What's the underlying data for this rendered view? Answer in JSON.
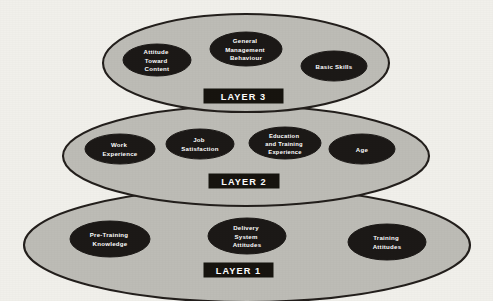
{
  "diagram": {
    "background_color": "#f1f0eb",
    "layer_fill_color": "#bdbcb6",
    "layer_stroke_color": "#231f1c",
    "node_fill_color": "#1c1917",
    "node_text_color": "#ffffff",
    "badge_fill_color": "#17140f",
    "badge_text_color": "#ffffff",
    "layers": [
      {
        "badge_label": "LAYER 3",
        "order": 3,
        "nodes": [
          {
            "lines": [
              "Attitude",
              "Toward",
              "Content"
            ]
          },
          {
            "lines": [
              "General",
              "Management",
              "Behaviour"
            ]
          },
          {
            "lines": [
              "Basic Skills"
            ]
          }
        ]
      },
      {
        "badge_label": "LAYER 2",
        "order": 2,
        "nodes": [
          {
            "lines": [
              "Work",
              "Experience"
            ]
          },
          {
            "lines": [
              "Job",
              "Satisfaction"
            ]
          },
          {
            "lines": [
              "Education",
              "and Training",
              "Experience"
            ]
          },
          {
            "lines": [
              "Age"
            ]
          }
        ]
      },
      {
        "badge_label": "LAYER 1",
        "order": 1,
        "nodes": [
          {
            "lines": [
              "Pre-Training",
              "Knowledge"
            ]
          },
          {
            "lines": [
              "Delivery",
              "System",
              "Attitudes"
            ]
          },
          {
            "lines": [
              "Training",
              "Attitudes"
            ]
          }
        ]
      }
    ]
  }
}
